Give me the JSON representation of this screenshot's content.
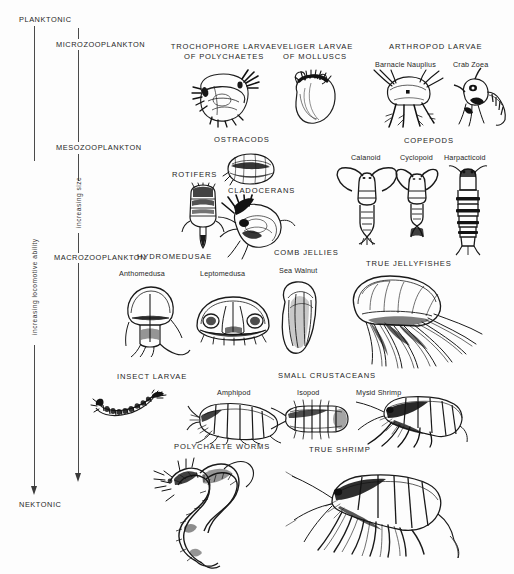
{
  "diagram": {
    "axes": {
      "locomotive": {
        "label": "increasing locomotive ability",
        "top_zone": "PLANKTONIC",
        "bottom_zone": "NEKTONIC"
      },
      "size": {
        "label": "increasing size",
        "zones": [
          "MICROZOOPLANKTON",
          "MESOZOOPLANKTON",
          "MACROZOOPLANKTON"
        ]
      }
    },
    "groups": [
      {
        "id": "trochophore-larvae",
        "title": "TROCHOPHORE LARVAE",
        "title_line2": "OF POLYCHAETES",
        "members": []
      },
      {
        "id": "veliger-larvae",
        "title": "VELIGER LARVAE",
        "title_line2": "OF MOLLUSCS",
        "members": []
      },
      {
        "id": "arthropod-larvae",
        "title": "ARTHROPOD LARVAE",
        "members": [
          "Barnacle Nauplius",
          "Crab Zoea"
        ]
      },
      {
        "id": "ostracods",
        "title": "OSTRACODS",
        "members": []
      },
      {
        "id": "rotifers",
        "title": "ROTIFERS",
        "members": []
      },
      {
        "id": "cladocerans",
        "title": "CLADOCERANS",
        "members": []
      },
      {
        "id": "copepods",
        "title": "COPEPODS",
        "members": [
          "Calanoid",
          "Cyclopoid",
          "Harpacticoid"
        ]
      },
      {
        "id": "hydromedusae",
        "title": "HYDROMEDUSAE",
        "members": [
          "Anthomedusa",
          "Leptomedusa"
        ]
      },
      {
        "id": "comb-jellies",
        "title": "COMB JELLIES",
        "members": [
          "Sea Walnut"
        ]
      },
      {
        "id": "true-jellyfishes",
        "title": "TRUE JELLYFISHES",
        "members": []
      },
      {
        "id": "insect-larvae",
        "title": "INSECT LARVAE",
        "members": []
      },
      {
        "id": "small-crustaceans",
        "title": "SMALL CRUSTACEANS",
        "members": [
          "Amphipod",
          "Isopod",
          "Mysid Shrimp"
        ]
      },
      {
        "id": "polychaete-worms",
        "title": "POLYCHAETE WORMS",
        "members": []
      },
      {
        "id": "true-shrimp",
        "title": "TRUE SHRIMP",
        "members": []
      }
    ],
    "colors": {
      "ink": "#1c1c1c",
      "axis": "#4a4a4a",
      "background": "#fdfdfd"
    }
  }
}
